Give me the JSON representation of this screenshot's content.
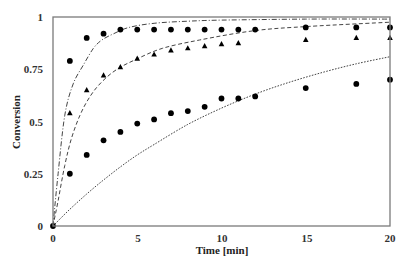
{
  "chart_data": {
    "type": "scatter",
    "title": "",
    "xlabel": "Time [min]",
    "ylabel": "Conversion",
    "xlim": [
      0,
      20
    ],
    "ylim": [
      0,
      1
    ],
    "xticks": [
      0,
      5,
      10,
      15,
      20
    ],
    "yticks": [
      0,
      0.25,
      0.5,
      0.75,
      1
    ],
    "xtick_labels": [
      "0",
      "5",
      "10",
      "15",
      "20"
    ],
    "ytick_labels": [
      "0",
      "0.25",
      "0.5",
      "0.75",
      "1"
    ],
    "grid": false,
    "legend": null,
    "series": [
      {
        "name": "Upper circles (experimental)",
        "kind": "markers",
        "marker": "circle",
        "x": [
          0,
          1,
          2,
          3,
          4,
          5,
          6,
          7,
          8,
          9,
          10,
          11,
          12,
          15,
          18,
          20
        ],
        "y": [
          0,
          0.79,
          0.9,
          0.92,
          0.94,
          0.94,
          0.94,
          0.94,
          0.94,
          0.94,
          0.94,
          0.94,
          0.94,
          0.95,
          0.95,
          0.95
        ]
      },
      {
        "name": "Triangles (experimental)",
        "kind": "markers",
        "marker": "triangle",
        "x": [
          1,
          2,
          3,
          4,
          5,
          6,
          7,
          8,
          9,
          10,
          11,
          15,
          18,
          20
        ],
        "y": [
          0.54,
          0.65,
          0.72,
          0.76,
          0.8,
          0.82,
          0.84,
          0.85,
          0.86,
          0.87,
          0.875,
          0.89,
          0.9,
          0.9
        ]
      },
      {
        "name": "Lower circles (experimental)",
        "kind": "markers",
        "marker": "circle",
        "x": [
          1,
          2,
          3,
          4,
          5,
          6,
          7,
          8,
          9,
          10,
          11,
          12,
          15,
          18,
          20
        ],
        "y": [
          0.25,
          0.34,
          0.41,
          0.45,
          0.49,
          0.51,
          0.54,
          0.55,
          0.57,
          0.61,
          0.61,
          0.62,
          0.66,
          0.68,
          0.7
        ]
      },
      {
        "name": "Model (dash-dot)",
        "kind": "line",
        "style": "dashdot",
        "x": [
          0,
          0.3,
          0.7,
          1.2,
          1.8,
          2.4,
          2.9,
          3.6,
          4.5,
          6,
          8,
          10,
          15,
          20
        ],
        "y": [
          0,
          0.25,
          0.53,
          0.68,
          0.77,
          0.85,
          0.89,
          0.92,
          0.95,
          0.97,
          0.98,
          0.985,
          0.99,
          0.99
        ]
      },
      {
        "name": "Model (dashed)",
        "kind": "line",
        "style": "dashed",
        "x": [
          0,
          0.3,
          0.7,
          1.1,
          1.6,
          2.2,
          2.9,
          3.8,
          5,
          6.5,
          8.7,
          12,
          15.2,
          20
        ],
        "y": [
          0,
          0.12,
          0.29,
          0.42,
          0.53,
          0.62,
          0.69,
          0.75,
          0.8,
          0.85,
          0.89,
          0.935,
          0.955,
          0.975
        ]
      },
      {
        "name": "Model (dotted)",
        "kind": "line",
        "style": "dotted",
        "x": [
          0,
          1,
          2,
          3,
          4,
          5,
          6,
          8,
          10,
          12,
          14,
          16,
          18,
          20
        ],
        "y": [
          0,
          0.08,
          0.153,
          0.22,
          0.283,
          0.34,
          0.39,
          0.486,
          0.564,
          0.631,
          0.687,
          0.735,
          0.776,
          0.81
        ]
      }
    ]
  },
  "axes": {
    "xlabel": "Time [min]",
    "ylabel": "Conversion",
    "xtick_labels": [
      "0",
      "5",
      "10",
      "15",
      "20"
    ],
    "ytick_labels": [
      "0",
      "0.25",
      "0.5",
      "0.75",
      "1"
    ]
  }
}
